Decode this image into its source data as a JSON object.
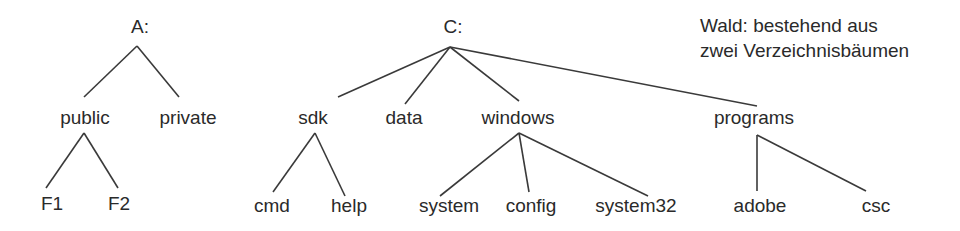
{
  "caption": {
    "line1": "Wald: bestehend aus",
    "line2": "zwei Verzeichnisbäumen"
  },
  "trees": [
    {
      "root": "A:",
      "level1": [
        "public",
        "private"
      ],
      "children": {
        "public": [
          "F1",
          "F2"
        ]
      }
    },
    {
      "root": "C:",
      "level1": [
        "sdk",
        "data",
        "windows",
        "programs"
      ],
      "children": {
        "sdk": [
          "cmd",
          "help"
        ],
        "windows": [
          "system",
          "config",
          "system32"
        ],
        "programs": [
          "adobe",
          "csc"
        ]
      }
    }
  ],
  "nodes": {
    "a_root": "A:",
    "public": "public",
    "private": "private",
    "f1": "F1",
    "f2": "F2",
    "c_root": "C:",
    "sdk": "sdk",
    "data": "data",
    "windows": "windows",
    "programs": "programs",
    "cmd": "cmd",
    "help": "help",
    "system": "system",
    "config": "config",
    "system32": "system32",
    "adobe": "adobe",
    "csc": "csc"
  },
  "colors": {
    "line": "#3a3a3a",
    "text": "#2a2a2a",
    "background": "#ffffff"
  }
}
